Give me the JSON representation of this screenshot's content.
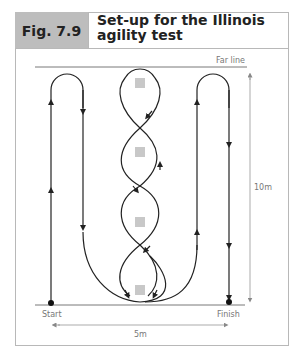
{
  "figure": {
    "label": "Fig. 7.9",
    "title_line1": "Set-up for the Illinois",
    "title_line2": "agility test"
  },
  "diagram": {
    "far_line_label": "Far line",
    "start_label": "Start",
    "finish_label": "Finish",
    "length_label": "10m",
    "width_label": "5m",
    "cone_count": 4,
    "colors": {
      "header_bg": "#bdbdbd",
      "path": "#222222",
      "cone": "#c8c8c8",
      "dimension": "#888888"
    }
  }
}
